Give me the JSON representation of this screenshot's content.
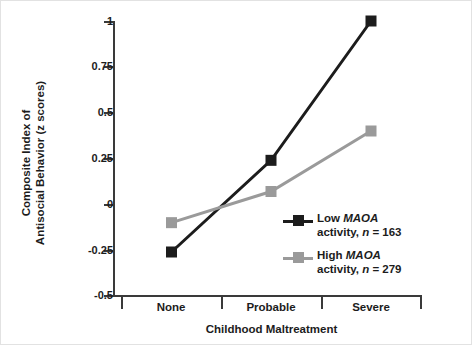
{
  "chart_data": {
    "type": "line",
    "title": "",
    "xlabel": "Childhood Maltreatment",
    "ylabel": "Composite Index of\nAntisocial Behavior (z scores)",
    "ylabel_line1": "Composite Index of",
    "ylabel_line2": "Antisocial Behavior (z scores)",
    "categories": [
      "None",
      "Probable",
      "Severe"
    ],
    "ylim": [
      -0.5,
      1
    ],
    "yticks": [
      1,
      0.75,
      0.5,
      0.25,
      0,
      -0.25,
      -0.5
    ],
    "ytick_labels": [
      "1",
      "0.75",
      "0.5",
      "0.25",
      "0",
      "-0.25",
      "-0.5"
    ],
    "grid": false,
    "legend_position": "inside-right-lower",
    "series": [
      {
        "name": "Low MAOA activity, n = 163",
        "legend_label_line1_plain": "Low ",
        "legend_label_line1_italic": "MAOA",
        "legend_label_line2_pre": "activity, ",
        "legend_label_line2_italic": "n",
        "legend_label_line2_post": " = 163",
        "color": "#1c1c1c",
        "marker": "square",
        "values": [
          -0.26,
          0.24,
          1.0
        ]
      },
      {
        "name": "High MAOA activity, n = 279",
        "legend_label_line1_plain": "High ",
        "legend_label_line1_italic": "MAOA",
        "legend_label_line2_pre": "activity, ",
        "legend_label_line2_italic": "n",
        "legend_label_line2_post": " = 279",
        "color": "#9a9a9a",
        "marker": "square",
        "values": [
          -0.1,
          0.07,
          0.4
        ]
      }
    ]
  },
  "axis": {
    "color": "#3a3a3a"
  }
}
